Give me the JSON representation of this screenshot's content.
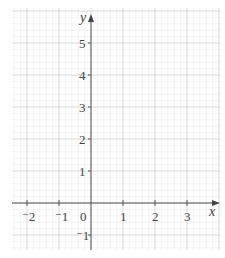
{
  "chart_data": {
    "type": "scatter",
    "title": "",
    "xlabel": "x",
    "ylabel": "y",
    "xlim": [
      -2.5,
      4.0
    ],
    "ylim": [
      -1.5,
      6.0
    ],
    "x_ticks": [
      "⁻2",
      "⁻1",
      "0",
      "1",
      "2",
      "3"
    ],
    "y_ticks": [
      "⁻1",
      "1",
      "2",
      "3",
      "4",
      "5"
    ],
    "grid": true,
    "series": [],
    "colors": {
      "axis": "#555555",
      "grid_major": "#cfcfcf",
      "grid_minor": "#ececec"
    }
  },
  "labels": {
    "x_axis": "x",
    "y_axis": "y",
    "origin": "0",
    "xt": {
      "m2": "⁻2",
      "m1": "⁻1",
      "p1": "1",
      "p2": "2",
      "p3": "3"
    },
    "yt": {
      "m1": "⁻1",
      "p1": "1",
      "p2": "2",
      "p3": "3",
      "p4": "4",
      "p5": "5"
    }
  }
}
